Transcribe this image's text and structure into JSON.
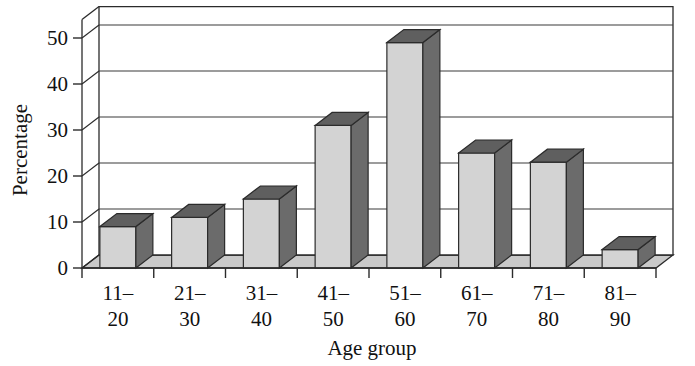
{
  "chart_data": {
    "type": "bar",
    "title": "",
    "subtitle": "",
    "xlabel": "Age group",
    "ylabel": "Percentage",
    "categories": [
      "11–20",
      "21–30",
      "31–40",
      "41–50",
      "51–60",
      "61–70",
      "71–80",
      "81–90"
    ],
    "category_lines": [
      [
        "11–",
        "20"
      ],
      [
        "21–",
        "30"
      ],
      [
        "31–",
        "40"
      ],
      [
        "41–",
        "50"
      ],
      [
        "51–",
        "60"
      ],
      [
        "61–",
        "70"
      ],
      [
        "71–",
        "80"
      ],
      [
        "81–",
        "90"
      ]
    ],
    "values": [
      9,
      11,
      15,
      31,
      49,
      25,
      23,
      4
    ],
    "ylim": [
      0,
      50
    ],
    "yticks": [
      0,
      10,
      20,
      30,
      40,
      50
    ],
    "ytick_labels": [
      "0",
      "10",
      "20",
      "30",
      "40",
      "50"
    ],
    "grid": true,
    "grid_axis": "y",
    "legend": false,
    "legend_position": "none",
    "style": "3d-column",
    "colors": {
      "bar_front": "#d3d3d3",
      "bar_side": "#6b6b6b",
      "bar_top": "#5f5f5f",
      "floor": "#c9c9c9",
      "wall": "#ffffff",
      "outline": "#2b2b2b",
      "gridline": "#3a3a3a",
      "text": "#111111"
    }
  }
}
